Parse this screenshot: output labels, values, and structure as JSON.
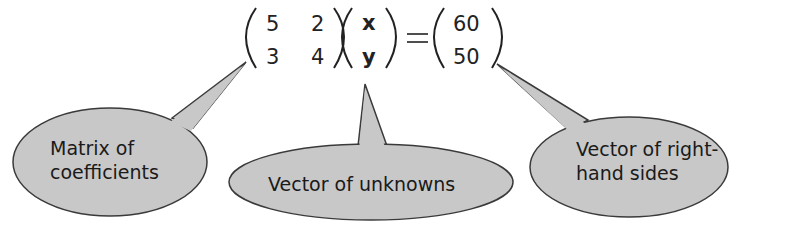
{
  "equation": {
    "matrix": [
      [
        "5",
        "2"
      ],
      [
        "3",
        "4"
      ]
    ],
    "unknowns": [
      "x",
      "y"
    ],
    "equals": "=",
    "rhs": [
      "60",
      "50"
    ]
  },
  "callouts": [
    {
      "id": "matrix",
      "lines": [
        "Matrix of",
        "coefficients"
      ]
    },
    {
      "id": "unknowns",
      "lines": [
        "Vector of unknowns"
      ]
    },
    {
      "id": "rhs",
      "lines": [
        "Vector of right-",
        "hand sides"
      ]
    }
  ],
  "colors": {
    "bubble_fill": "#c8c8c8",
    "bubble_stroke": "#3a3a3a",
    "text": "#1a1a1a"
  }
}
